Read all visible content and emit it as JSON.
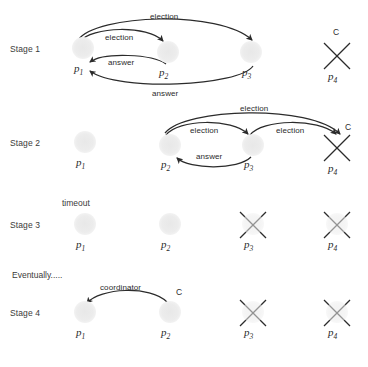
{
  "figure": {
    "background": "#ffffff",
    "stroke_color": "#2b2b2b",
    "node_color": "#ececec"
  },
  "stages": [
    {
      "id": "stage-1",
      "label": "Stage 1",
      "label_x": 10,
      "label_y": 44,
      "nodes": [
        {
          "id": "p1",
          "name": "p",
          "sub": "1",
          "cx": 83,
          "cy": 48,
          "state": "alive",
          "name_x": 74,
          "name_y": 62
        },
        {
          "id": "p2",
          "name": "p",
          "sub": "2",
          "cx": 168,
          "cy": 52,
          "state": "alive",
          "name_x": 159,
          "name_y": 66
        },
        {
          "id": "p3",
          "name": "p",
          "sub": "3",
          "cx": 251,
          "cy": 52,
          "state": "alive",
          "name_x": 242,
          "name_y": 66
        },
        {
          "id": "p4",
          "name": "p",
          "sub": "4",
          "cx": 337,
          "cy": 56,
          "state": "crashed",
          "name_x": 328,
          "name_y": 74
        }
      ],
      "crown": {
        "label": "C",
        "x": 333,
        "y": 28
      },
      "edges": [
        {
          "label": "election",
          "label_x": 150,
          "label_y": 12,
          "from": "p1",
          "to": "p3"
        },
        {
          "label": "election",
          "label_x": 105,
          "label_y": 35,
          "from": "p1",
          "to": "p2"
        },
        {
          "label": "answer",
          "label_x": 108,
          "label_y": 62,
          "from": "p2",
          "to": "p1"
        },
        {
          "label": "answer",
          "label_x": 152,
          "label_y": 91,
          "from": "p3",
          "to": "p1"
        }
      ]
    },
    {
      "id": "stage-2",
      "label": "Stage 2",
      "label_x": 10,
      "label_y": 141,
      "nodes": [
        {
          "id": "p1",
          "name": "p",
          "sub": "1",
          "cx": 85,
          "cy": 142,
          "state": "alive",
          "name_x": 76,
          "name_y": 160
        },
        {
          "id": "p2",
          "name": "p",
          "sub": "2",
          "cx": 170,
          "cy": 145,
          "state": "alive",
          "name_x": 161,
          "name_y": 160
        },
        {
          "id": "p3",
          "name": "p",
          "sub": "3",
          "cx": 253,
          "cy": 145,
          "state": "alive",
          "name_x": 244,
          "name_y": 160
        },
        {
          "id": "p4",
          "name": "p",
          "sub": "4",
          "cx": 337,
          "cy": 148,
          "state": "crashed",
          "name_x": 328,
          "name_y": 166
        }
      ],
      "crown": {
        "label": "C",
        "x": 345,
        "y": 126
      },
      "edges": [
        {
          "label": "election",
          "label_x": 240,
          "label_y": 106,
          "from": "p2",
          "to": "p4"
        },
        {
          "label": "election",
          "label_x": 190,
          "label_y": 128,
          "from": "p2",
          "to": "p3"
        },
        {
          "label": "election",
          "label_x": 275,
          "label_y": 128,
          "from": "p3",
          "to": "p4"
        },
        {
          "label": "answer",
          "label_x": 195,
          "label_y": 155,
          "from": "p3",
          "to": "p2"
        }
      ]
    },
    {
      "id": "stage-3",
      "label": "Stage 3",
      "label_x": 10,
      "label_y": 224,
      "nodes": [
        {
          "id": "p1",
          "name": "p",
          "sub": "1",
          "cx": 85,
          "cy": 224,
          "state": "alive",
          "name_x": 76,
          "name_y": 242
        },
        {
          "id": "p2",
          "name": "p",
          "sub": "2",
          "cx": 170,
          "cy": 224,
          "state": "alive",
          "name_x": 161,
          "name_y": 242
        },
        {
          "id": "p3",
          "name": "p",
          "sub": "3",
          "cx": 253,
          "cy": 224,
          "state": "crashed",
          "name_x": 244,
          "name_y": 242
        },
        {
          "id": "p4",
          "name": "p",
          "sub": "4",
          "cx": 337,
          "cy": 224,
          "state": "crashed",
          "name_x": 328,
          "name_y": 242
        }
      ],
      "annotation": {
        "label": "timeout",
        "x": 62,
        "y": 202
      },
      "edges": []
    },
    {
      "id": "stage-4",
      "label": "Stage 4",
      "label_x": 10,
      "label_y": 312,
      "nodes": [
        {
          "id": "p1",
          "name": "p",
          "sub": "1",
          "cx": 85,
          "cy": 312,
          "state": "alive",
          "name_x": 76,
          "name_y": 330
        },
        {
          "id": "p2",
          "name": "p",
          "sub": "2",
          "cx": 170,
          "cy": 312,
          "state": "alive",
          "name_x": 161,
          "name_y": 330
        },
        {
          "id": "p3",
          "name": "p",
          "sub": "3",
          "cx": 253,
          "cy": 312,
          "state": "crashed",
          "name_x": 244,
          "name_y": 330
        },
        {
          "id": "p4",
          "name": "p",
          "sub": "4",
          "cx": 337,
          "cy": 312,
          "state": "crashed",
          "name_x": 328,
          "name_y": 330
        }
      ],
      "crown": {
        "label": "C",
        "x": 175,
        "y": 290
      },
      "edges": [
        {
          "label": "coordinator",
          "label_x": 100,
          "label_y": 287,
          "from": "p2",
          "to": "p1"
        }
      ]
    }
  ],
  "notes": {
    "eventually": {
      "label": "Eventually.....",
      "x": 12,
      "y": 274
    }
  }
}
